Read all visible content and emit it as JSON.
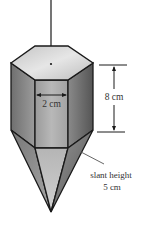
{
  "figure": {
    "labels": {
      "width": "2 cm",
      "height": "8 cm",
      "slant_line1": "slant height",
      "slant_line2": "5 cm"
    },
    "shape": "hexagonal prism with hexagonal pyramid point (plumb bob)",
    "colors": {
      "outline": "#1a1a1a",
      "top_face": "#d6d6d6",
      "front_face": "#a8a8a8",
      "left_face": "#8c8c8c",
      "right_face": "#6e6e6e",
      "text": "#333333"
    }
  }
}
